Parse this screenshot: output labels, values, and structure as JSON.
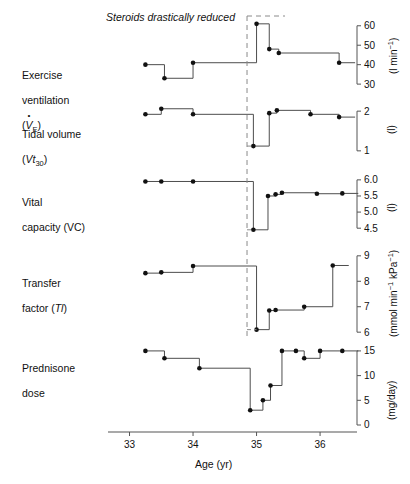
{
  "figure": {
    "annotation": "Steroids drastically reduced",
    "xaxis": {
      "title": "Age (yr)",
      "ticks": [
        33,
        34,
        35,
        36
      ],
      "range": [
        32.85,
        36.55
      ]
    },
    "intervention_line_x": 34.85,
    "colors": {
      "line": "#4d4d4d",
      "marker": "#111111",
      "dashed": "#8a8a8a",
      "axis": "#555555",
      "text": "#111111"
    }
  },
  "chart_data": [
    {
      "type": "line",
      "panel": 1,
      "title": "Exercise ventilation",
      "label_line1": "Exercise",
      "label_line2": "ventilation",
      "label_line3": "(VE)",
      "symbol": "V̇E",
      "ylabel": "(l min⁻¹)",
      "units": "l min-1",
      "ticks": [
        30,
        40,
        50,
        60
      ],
      "ylim": [
        28,
        64
      ],
      "x": [
        33.25,
        33.55,
        34.0,
        35.0,
        35.2,
        35.35,
        36.3
      ],
      "values": [
        40,
        33,
        41,
        61,
        48,
        46,
        41
      ],
      "grid": false
    },
    {
      "type": "line",
      "panel": 2,
      "title": "Tidal volume",
      "label_line1": "Tidal volume",
      "label_line2": "(Vt30)",
      "symbol": "Vt₃₀",
      "ylabel": "(l)",
      "units": "l",
      "ticks": [
        1.0,
        2.0
      ],
      "ylim": [
        0.82,
        2.18
      ],
      "x": [
        33.25,
        33.5,
        34.0,
        34.95,
        35.2,
        35.32,
        35.85,
        36.3
      ],
      "values": [
        1.92,
        2.06,
        1.92,
        1.12,
        1.95,
        2.02,
        1.92,
        1.85
      ],
      "grid": false
    },
    {
      "type": "line",
      "panel": 3,
      "title": "Vital capacity",
      "label_line1": "Vital",
      "label_line2": "capacity (VC)",
      "symbol": "VC",
      "ylabel": "(l)",
      "units": "l",
      "ticks": [
        4.5,
        5.0,
        5.5,
        6.0
      ],
      "ylim": [
        4.32,
        6.12
      ],
      "x": [
        33.25,
        33.5,
        34.0,
        34.95,
        35.18,
        35.3,
        35.4,
        35.95,
        36.35
      ],
      "values": [
        5.95,
        5.95,
        5.95,
        4.45,
        5.5,
        5.55,
        5.6,
        5.57,
        5.58
      ],
      "grid": false
    },
    {
      "type": "line",
      "panel": 4,
      "title": "Transfer factor",
      "label_line1": "Transfer",
      "label_line2": "factor (Tl)",
      "symbol": "Tl",
      "ylabel": "(mmol min⁻¹ kPa⁻¹)",
      "units": "mmol min-1 kPa-1",
      "ticks": [
        6,
        7,
        8,
        9
      ],
      "ylim": [
        5.85,
        9.15
      ],
      "x": [
        33.25,
        33.5,
        34.0,
        35.0,
        35.2,
        35.3,
        35.75,
        36.2
      ],
      "values": [
        8.32,
        8.35,
        8.6,
        6.1,
        6.85,
        6.87,
        7.0,
        8.62
      ],
      "grid": false
    },
    {
      "type": "line",
      "panel": 5,
      "title": "Prednisone dose",
      "label_line1": "Prednisone",
      "label_line2": "dose",
      "symbol": "Prednisone dose",
      "ylabel": "(mg/day)",
      "units": "mg/day",
      "ticks": [
        0,
        5,
        10,
        15
      ],
      "ylim": [
        0,
        16.4
      ],
      "x": [
        33.25,
        33.55,
        34.1,
        34.9,
        35.1,
        35.22,
        35.4,
        35.62,
        35.75,
        36.0,
        36.35
      ],
      "values": [
        15,
        13.5,
        11.5,
        3,
        5,
        8,
        15,
        15,
        13.5,
        15,
        15
      ],
      "grid": false
    }
  ]
}
